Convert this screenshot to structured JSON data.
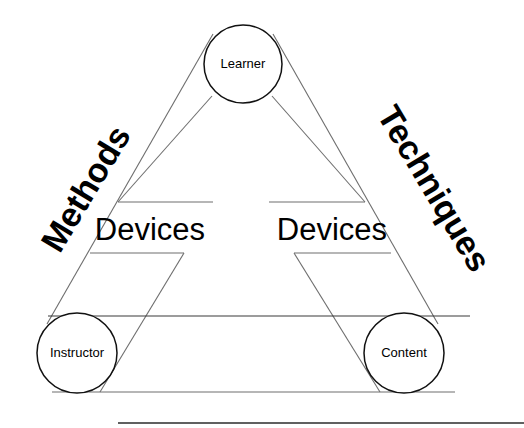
{
  "diagram": {
    "type": "instructional-communication-triangle",
    "canvas": {
      "width": 524,
      "height": 428,
      "background": "#ffffff"
    },
    "stroke": {
      "thin": "#6e6e6e",
      "medium": "#3a3a3a",
      "dark": "#111111"
    },
    "nodes": [
      {
        "id": "learner",
        "label": "Learner",
        "cx": 243,
        "cy": 64,
        "r": 39
      },
      {
        "id": "instructor",
        "label": "Instructor",
        "cx": 77,
        "cy": 353,
        "r": 40
      },
      {
        "id": "content",
        "label": "Content",
        "cx": 404,
        "cy": 353,
        "r": 40
      }
    ],
    "edge_labels": [
      {
        "id": "methods",
        "label": "Methods",
        "x": 88,
        "y": 190,
        "rotate": -59
      },
      {
        "id": "techniques",
        "label": "Techniques",
        "x": 432,
        "y": 190,
        "rotate": 59
      }
    ],
    "device_labels": [
      {
        "id": "devices-left",
        "label": "Devices",
        "x": 150,
        "y": 232
      },
      {
        "id": "devices-right",
        "label": "Devices",
        "x": 332,
        "y": 232
      }
    ]
  }
}
